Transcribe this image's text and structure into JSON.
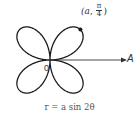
{
  "diagram": {
    "type": "polar-rose",
    "equation": "r = a sin 2θ",
    "caption": "r = a sin 2θ",
    "point_label": {
      "open": "(",
      "r": "a",
      "sep": ",",
      "theta_num": "π",
      "theta_den": "4",
      "close": ")"
    },
    "origin_label": "0",
    "axis_label": "A",
    "petals": 4,
    "colors": {
      "curve": "#1a1a1a",
      "text": "#333333",
      "background": "#ffffff"
    }
  }
}
